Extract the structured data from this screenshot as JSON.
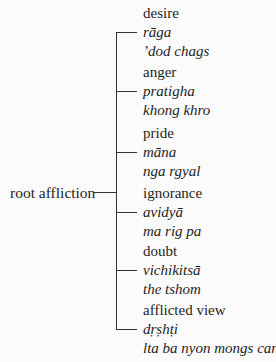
{
  "root": {
    "label": "root affliction"
  },
  "branches": [
    {
      "english": "desire",
      "sanskrit": "rāga",
      "tibetan": "’dod chags"
    },
    {
      "english": "anger",
      "sanskrit": "pratigha",
      "tibetan": "khong khro"
    },
    {
      "english": "pride",
      "sanskrit": "māna",
      "tibetan": "nga rgyal"
    },
    {
      "english": "ignorance",
      "sanskrit": "avidyā",
      "tibetan": "ma rig pa"
    },
    {
      "english": "doubt",
      "sanskrit": "vichikitsā",
      "tibetan": "the tshom"
    },
    {
      "english": "afflicted view",
      "sanskrit": "dṛṣhṭi",
      "tibetan": "lta ba nyon mongs can"
    }
  ]
}
